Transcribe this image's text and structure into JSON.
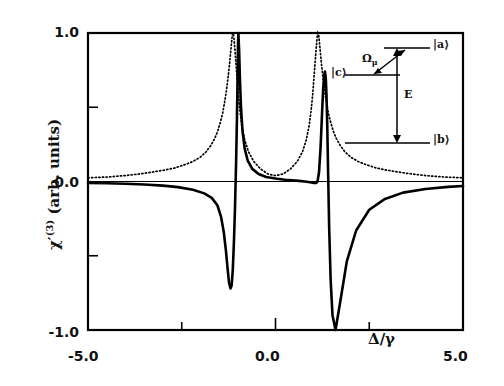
{
  "figure": {
    "y_axis_title_main": "χ",
    "y_axis_title_prime": "′",
    "y_axis_title_sup": "(3)",
    "y_axis_title_units": " (arb. units)",
    "x_axis_title": "Δ/γ"
  },
  "axis_labels": {
    "y_top": "1.0",
    "y_zero": "0.0",
    "y_bottom": "-1.0",
    "x_left": "-5.0",
    "x_mid": "0.0",
    "x_right": "5.0"
  },
  "inset": {
    "state_a": "|a⟩",
    "state_c": "|c⟩",
    "state_b": "|b⟩",
    "coupling_label": "Ω",
    "coupling_sub": "μ",
    "field_label": "E"
  },
  "chart_data": {
    "type": "line",
    "title": "",
    "xlabel": "Δ/γ",
    "ylabel": "χ′(3) (arb. units)",
    "xlim": [
      -5.0,
      5.0
    ],
    "ylim": [
      -1.0,
      1.0
    ],
    "xticks": [
      -5.0,
      -2.5,
      0.0,
      2.5,
      5.0
    ],
    "xticklabels": [
      "-5.0",
      "",
      "0.0",
      "",
      "5.0"
    ],
    "yticks": [
      -1.0,
      -0.5,
      0.0,
      0.5,
      1.0
    ],
    "yticklabels": [
      "-1.0",
      "",
      "0.0",
      "",
      "1.0"
    ],
    "grid": false,
    "legend": "none",
    "series": [
      {
        "name": "dispersive (solid)",
        "style": "solid",
        "linewidth": 2.6,
        "description": "Dispersive real part of chi^(3): two sharp dispersion resonances; negative dip then sharp positive peak near Delta/gamma = -1.0, and positive peak then deep negative dip near Delta/gamma = +1.3",
        "x": [
          -5.0,
          -4.5,
          -4.0,
          -3.5,
          -3.0,
          -2.6,
          -2.2,
          -1.9,
          -1.7,
          -1.55,
          -1.45,
          -1.38,
          -1.32,
          -1.28,
          -1.24,
          -1.2,
          -1.17,
          -1.14,
          -1.11,
          -1.08,
          -1.05,
          -1.03,
          -1.01,
          -1.0,
          -0.99,
          -0.97,
          -0.95,
          -0.92,
          -0.88,
          -0.82,
          -0.74,
          -0.62,
          -0.45,
          -0.25,
          0.0,
          0.25,
          0.45,
          0.62,
          0.78,
          0.92,
          1.02,
          1.08,
          1.12,
          1.16,
          1.2,
          1.24,
          1.27,
          1.3,
          1.32,
          1.34,
          1.36,
          1.38,
          1.4,
          1.43,
          1.47,
          1.52,
          1.6,
          1.72,
          1.9,
          2.15,
          2.5,
          2.9,
          3.4,
          4.0,
          4.6,
          5.0
        ],
        "y": [
          -0.01,
          -0.012,
          -0.015,
          -0.02,
          -0.028,
          -0.038,
          -0.055,
          -0.08,
          -0.11,
          -0.16,
          -0.24,
          -0.34,
          -0.47,
          -0.58,
          -0.68,
          -0.72,
          -0.7,
          -0.6,
          -0.42,
          -0.18,
          0.14,
          0.4,
          0.72,
          0.92,
          1.0,
          0.88,
          0.7,
          0.5,
          0.34,
          0.22,
          0.14,
          0.085,
          0.05,
          0.03,
          0.02,
          0.012,
          0.008,
          0.004,
          0.0,
          -0.005,
          -0.01,
          -0.01,
          0.0,
          0.06,
          0.22,
          0.45,
          0.62,
          0.72,
          0.74,
          0.7,
          0.58,
          0.38,
          0.1,
          -0.3,
          -0.66,
          -0.9,
          -1.0,
          -0.82,
          -0.54,
          -0.33,
          -0.19,
          -0.12,
          -0.075,
          -0.05,
          -0.036,
          -0.03
        ]
      },
      {
        "name": "absorptive (dotted)",
        "style": "dotted",
        "linewidth": 1.7,
        "description": "Absorptive imaginary part of chi^(3): two Lorentzian-like peaks reaching 1.0 near Delta/gamma = -1.15 and +1.15, decaying toward zero at the edges",
        "x": [
          -5.0,
          -4.5,
          -4.0,
          -3.5,
          -3.0,
          -2.7,
          -2.4,
          -2.2,
          -2.0,
          -1.85,
          -1.72,
          -1.62,
          -1.54,
          -1.47,
          -1.41,
          -1.36,
          -1.31,
          -1.27,
          -1.23,
          -1.2,
          -1.17,
          -1.15,
          -1.13,
          -1.11,
          -1.08,
          -1.05,
          -1.02,
          -0.99,
          -0.95,
          -0.9,
          -0.82,
          -0.72,
          -0.58,
          -0.4,
          -0.2,
          0.0,
          0.2,
          0.4,
          0.58,
          0.72,
          0.82,
          0.9,
          0.95,
          0.99,
          1.02,
          1.05,
          1.08,
          1.11,
          1.13,
          1.15,
          1.17,
          1.2,
          1.23,
          1.27,
          1.31,
          1.36,
          1.41,
          1.47,
          1.54,
          1.62,
          1.72,
          1.85,
          2.0,
          2.2,
          2.4,
          2.7,
          3.0,
          3.5,
          4.0,
          4.5,
          5.0
        ],
        "y": [
          0.025,
          0.03,
          0.04,
          0.055,
          0.075,
          0.09,
          0.115,
          0.135,
          0.165,
          0.2,
          0.245,
          0.29,
          0.34,
          0.4,
          0.46,
          0.53,
          0.61,
          0.69,
          0.78,
          0.86,
          0.94,
          0.99,
          1.0,
          0.97,
          0.88,
          0.78,
          0.68,
          0.58,
          0.48,
          0.38,
          0.28,
          0.2,
          0.135,
          0.085,
          0.05,
          0.04,
          0.05,
          0.085,
          0.135,
          0.2,
          0.28,
          0.38,
          0.48,
          0.58,
          0.68,
          0.78,
          0.88,
          0.97,
          1.0,
          0.99,
          0.94,
          0.86,
          0.78,
          0.69,
          0.61,
          0.53,
          0.46,
          0.4,
          0.34,
          0.29,
          0.245,
          0.2,
          0.165,
          0.135,
          0.115,
          0.09,
          0.075,
          0.055,
          0.04,
          0.03,
          0.025
        ]
      }
    ]
  }
}
